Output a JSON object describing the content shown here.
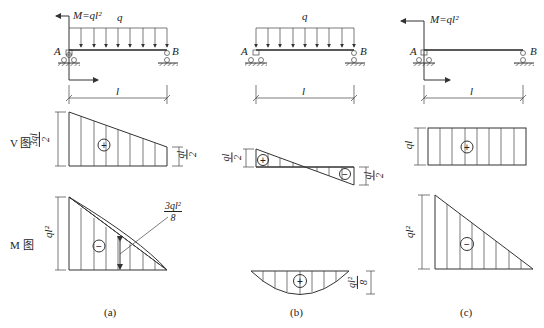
{
  "diagram": {
    "panels": [
      {
        "id": "a",
        "caption": "(a)",
        "beam": {
          "left_support": "A",
          "right_support": "B",
          "span_label": "l",
          "load_label": "q",
          "moment_label": "M=ql²",
          "has_distributed_load": true,
          "has_end_moment": true
        },
        "shear": {
          "sign": "+",
          "left_value": "3ql/2",
          "left_num": "3ql",
          "left_den": "2",
          "right_value": "ql/2",
          "right_num": "ql",
          "right_den": "2",
          "shape": "trapezoid"
        },
        "moment": {
          "sign": "−",
          "left_value": "ql²",
          "annotation": "3ql²/8",
          "annotation_num": "3ql²",
          "annotation_den": "8",
          "shape": "triangle-with-parabola"
        }
      },
      {
        "id": "b",
        "caption": "(b)",
        "beam": {
          "left_support": "A",
          "right_support": "B",
          "span_label": "l",
          "load_label": "q",
          "has_distributed_load": true,
          "has_end_moment": false
        },
        "shear": {
          "sign_left": "+",
          "sign_right": "−",
          "left_value": "ql/2",
          "left_num": "ql",
          "left_den": "2",
          "right_value": "ql/2",
          "right_num": "ql",
          "right_den": "2",
          "shape": "antisymmetric-triangles"
        },
        "moment": {
          "sign": "+",
          "value": "ql²/8",
          "value_num": "ql²",
          "value_den": "8",
          "shape": "parabola"
        }
      },
      {
        "id": "c",
        "caption": "(c)",
        "beam": {
          "left_support": "A",
          "right_support": "B",
          "span_label": "l",
          "moment_label": "M=ql²",
          "has_distributed_load": false,
          "has_end_moment": true
        },
        "shear": {
          "sign": "+",
          "value": "ql",
          "shape": "rectangle"
        },
        "moment": {
          "sign": "−",
          "value": "ql²",
          "shape": "triangle"
        }
      }
    ],
    "row_labels": {
      "shear": "V 图",
      "moment": "M 图"
    }
  }
}
